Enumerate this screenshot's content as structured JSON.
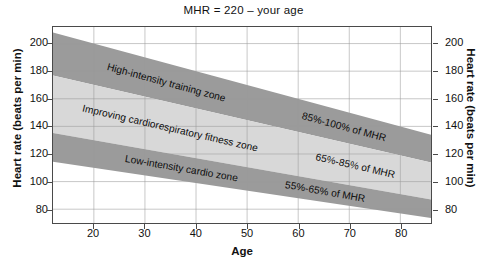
{
  "chart_data": {
    "type": "area",
    "title": "MHR = 220 – your age",
    "xlabel": "Age",
    "ylabel": "Heart rate (beats per min)",
    "ylabel_right": "Heart rate (beats per min)",
    "xlim": [
      12,
      86
    ],
    "ylim": [
      70,
      212
    ],
    "xticks": [
      20,
      30,
      40,
      50,
      60,
      70,
      80
    ],
    "yticks": [
      80,
      100,
      120,
      140,
      160,
      180,
      200
    ],
    "grid": true,
    "legend_position": "inline-annotations",
    "formula": "MHR = 220 - age",
    "bands": [
      {
        "name": "High-intensity training zone",
        "label": "High-intensity training zone",
        "pct_label": "85%-100% of MHR",
        "pct_low": 85,
        "pct_high": 100,
        "color": "#9b9b9b",
        "x_start": 12,
        "x_end": 86,
        "y_top_start": 208,
        "y_bottom_start": 176.8,
        "y_top_end": 134,
        "y_bottom_end": 113.9
      },
      {
        "name": "Improving cardiorespiratory fitness zone",
        "label": "Improving cardiorespiratory fitness zone",
        "pct_label": "65%-85% of MHR",
        "pct_low": 65,
        "pct_high": 85,
        "color": "#d8d8d8",
        "x_start": 12,
        "x_end": 86,
        "y_top_start": 176.8,
        "y_bottom_start": 135.2,
        "y_top_end": 113.9,
        "y_bottom_end": 87.1
      },
      {
        "name": "Low-intensity cardio zone",
        "label": "Low-intensity cardio zone",
        "pct_label": "55%-65% of MHR",
        "pct_low": 55,
        "pct_high": 65,
        "color": "#9b9b9b",
        "x_start": 12,
        "x_end": 86,
        "y_top_start": 135.2,
        "y_bottom_start": 114.4,
        "y_top_end": 87.1,
        "y_bottom_end": 73.7
      }
    ],
    "colors": {
      "band_dark": "#9b9b9b",
      "band_light": "#d8d8d8",
      "grid": "#9a9a9a",
      "frame": "#4a4a4a",
      "text": "#111111",
      "background": "#ffffff"
    }
  }
}
